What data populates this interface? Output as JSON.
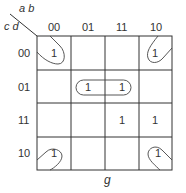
{
  "kmap": {
    "var_cols": "a b",
    "var_rows": "c d",
    "col_headers": [
      "00",
      "01",
      "11",
      "10"
    ],
    "row_headers": [
      "00",
      "01",
      "11",
      "10"
    ],
    "cells": [
      [
        "1",
        "",
        "",
        "1"
      ],
      [
        "",
        "1",
        "1",
        ""
      ],
      [
        "",
        "",
        "1",
        "1"
      ],
      [
        "1",
        "",
        "",
        "1"
      ]
    ],
    "function_label": "g",
    "groups": [
      "corners (00/00, 00/10, 10/00, 10/10)",
      "row 01 cols 01-11"
    ]
  }
}
